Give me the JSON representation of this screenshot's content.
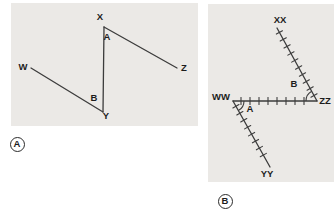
{
  "colors": {
    "page_bg": "#ffffff",
    "panel_bg": "#ebe9e6",
    "line": "#3c3c3c",
    "text": "#1c1c1c",
    "badge_border": "#2b2b2b"
  },
  "panels": [
    {
      "badge": "A",
      "box": {
        "left": 11,
        "top": 3,
        "width": 187,
        "height": 123
      },
      "badge_pos": {
        "cx": 17,
        "cy": 144
      },
      "segments": [
        {
          "name": "segment-X-Y",
          "from": [
            93,
            24
          ],
          "to": [
            92,
            109
          ],
          "hatched": false
        },
        {
          "name": "segment-X-Z",
          "from": [
            93,
            24
          ],
          "to": [
            166,
            65
          ],
          "hatched": false
        },
        {
          "name": "segment-W-Y",
          "from": [
            20,
            65
          ],
          "to": [
            92,
            109
          ],
          "hatched": false
        }
      ],
      "arcs": [],
      "labels": [
        {
          "text": "X",
          "x": 89,
          "y": 17,
          "name": "label-X"
        },
        {
          "text": "A",
          "x": 96,
          "y": 37,
          "name": "label-A"
        },
        {
          "text": "Z",
          "x": 173,
          "y": 68,
          "name": "label-Z"
        },
        {
          "text": "W",
          "x": 12,
          "y": 67,
          "name": "label-W"
        },
        {
          "text": "B",
          "x": 83,
          "y": 98,
          "name": "label-B"
        },
        {
          "text": "Y",
          "x": 95,
          "y": 116,
          "name": "label-Y"
        }
      ]
    },
    {
      "badge": "B",
      "box": {
        "left": 208,
        "top": 4,
        "width": 126,
        "height": 178
      },
      "badge_pos": {
        "cx": 225,
        "cy": 201
      },
      "segments": [
        {
          "name": "segment-XX-ZZ",
          "from": [
            69,
            24
          ],
          "to": [
            109,
            97
          ],
          "hatched": true,
          "spacing": 8,
          "margin": 5
        },
        {
          "name": "segment-WW-ZZ",
          "from": [
            25,
            97
          ],
          "to": [
            109,
            97
          ],
          "hatched": true,
          "spacing": 9,
          "margin": 8
        },
        {
          "name": "segment-WW-YY",
          "from": [
            25,
            97
          ],
          "to": [
            62,
            163
          ],
          "hatched": true,
          "spacing": 8,
          "margin": 6
        }
      ],
      "arcs": [
        {
          "name": "angle-arc-B",
          "d": "M 98 97 A 11 11 0 0 1 103.7 87.3"
        },
        {
          "name": "angle-arc-A",
          "d": "M 36 97 A 11 11 0 0 1 30.4 106.6"
        }
      ],
      "labels": [
        {
          "text": "XX",
          "x": 72,
          "y": 19,
          "name": "label-XX"
        },
        {
          "text": "ZZ",
          "x": 117,
          "y": 100,
          "name": "label-ZZ"
        },
        {
          "text": "WW",
          "x": 13,
          "y": 96,
          "name": "label-WW"
        },
        {
          "text": "YY",
          "x": 59,
          "y": 173,
          "name": "label-YY"
        },
        {
          "text": "B",
          "x": 86,
          "y": 83,
          "name": "label-B"
        },
        {
          "text": "A",
          "x": 42,
          "y": 108,
          "name": "label-A"
        }
      ]
    }
  ]
}
